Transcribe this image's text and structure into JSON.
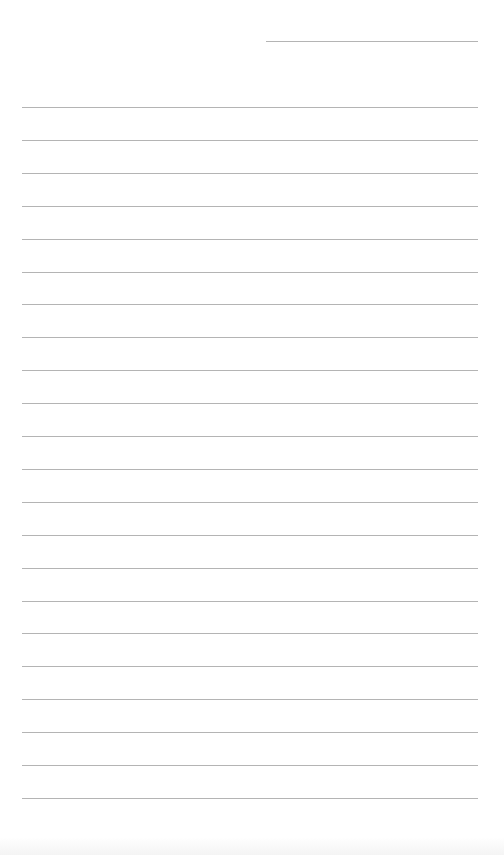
{
  "document": {
    "type": "lined paper",
    "header_line": {
      "top": 41,
      "left": 266,
      "width": 212
    },
    "ruled_lines": {
      "count": 22,
      "first_top": 107,
      "spacing": 32.9,
      "left": 22,
      "width": 456
    },
    "colors": {
      "paper": "#ffffff",
      "line": "#b4b4b4"
    }
  }
}
